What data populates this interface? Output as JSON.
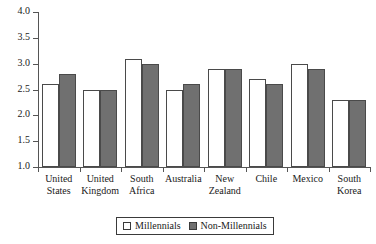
{
  "chart_data": {
    "type": "bar",
    "title": "",
    "subtitle": "",
    "xlabel": "",
    "ylabel": "",
    "ylim": [
      1.0,
      4.0
    ],
    "yticks": [
      "1.0",
      "1.5",
      "2.0",
      "2.5",
      "3.0",
      "3.5",
      "4.0"
    ],
    "ytick_values": [
      1.0,
      1.5,
      2.0,
      2.5,
      3.0,
      3.5,
      4.0
    ],
    "grid": false,
    "legend_position": "bottom-center",
    "categories": [
      "United States",
      "United Kingdom",
      "South Africa",
      "Australia",
      "New Zealand",
      "Chile",
      "Mexico",
      "South Korea"
    ],
    "category_lines": [
      [
        "United",
        "States"
      ],
      [
        "United",
        "Kingdom"
      ],
      [
        "South",
        "Africa"
      ],
      [
        "Australia",
        ""
      ],
      [
        "New",
        "Zealand"
      ],
      [
        "Chile",
        ""
      ],
      [
        "Mexico",
        ""
      ],
      [
        "South",
        "Korea"
      ]
    ],
    "series": [
      {
        "name": "Millennials",
        "color": "#ffffff",
        "values": [
          2.6,
          2.5,
          3.1,
          2.5,
          2.9,
          2.7,
          3.0,
          2.3
        ]
      },
      {
        "name": "Non-Millennials",
        "color": "#707070",
        "values": [
          2.8,
          2.5,
          3.0,
          2.6,
          2.9,
          2.6,
          2.9,
          2.3
        ]
      }
    ]
  },
  "legend": {
    "entries": [
      {
        "label": "Millennials",
        "style": "open"
      },
      {
        "label": "Non-Millennials",
        "style": "filled"
      }
    ]
  },
  "colors": {
    "axis": "#555555",
    "bar_outline": "#4a4a4a",
    "millennials_fill": "#ffffff",
    "non_millennials_fill": "#707070",
    "text": "#1a1a1a",
    "background": "#ffffff"
  }
}
